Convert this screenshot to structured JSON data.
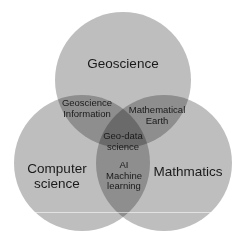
{
  "diagram": {
    "type": "venn",
    "circles": [
      {
        "id": "geoscience",
        "label": "Geoscience",
        "cx": 123,
        "cy": 80,
        "r": 68
      },
      {
        "id": "computer-science",
        "label_lines": [
          "Computer",
          "science"
        ],
        "cx": 82,
        "cy": 163,
        "r": 68
      },
      {
        "id": "mathmatics",
        "label": "Mathmatics",
        "cx": 164,
        "cy": 163,
        "r": 68
      }
    ],
    "intersections": {
      "geo_cs": [
        "Geoscience",
        "Information"
      ],
      "geo_math": [
        "Mathematical",
        "Earth"
      ],
      "all_three": [
        "Geo-data",
        "science"
      ],
      "cs_math": [
        "AI",
        "Machine",
        "learning"
      ]
    },
    "colors": {
      "circle_fill": "#9a9a9a",
      "circle_opacity": 0.72,
      "background": "#ffffff",
      "text": "#1a1a1a"
    }
  }
}
